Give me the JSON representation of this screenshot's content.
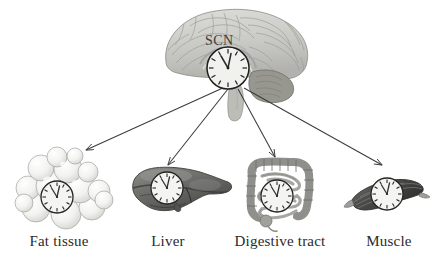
{
  "figure": {
    "title_visible": false,
    "background_color": "#ffffff",
    "brain": {
      "region_label": "SCN",
      "icon_name": "brain-sagittal-illustration",
      "fill_color": "#cfcfcb",
      "outline_color": "#8c8c88",
      "cerebellum_color": "#9a9a96",
      "brainstem_color": "#b5b5b1"
    },
    "clock": {
      "icon_name": "clock-face",
      "face_color": "#f4f4f2",
      "rim_color": "#262626",
      "hand_color": "#3a3a3a",
      "time_shown": "11:57"
    },
    "arrow": {
      "color": "#3c3c3c",
      "count": 4
    },
    "targets": [
      {
        "label": "Fat tissue",
        "icon_name": "fat-tissue-adipocytes-illustration",
        "fill_color": "#f0f0ee",
        "outline_color": "#a9a9a5"
      },
      {
        "label": "Liver",
        "icon_name": "liver-illustration",
        "fill_color": "#6f6f6c",
        "outline_color": "#3f3f3d"
      },
      {
        "label": "Digestive tract",
        "icon_name": "digestive-tract-intestines-illustration",
        "fill_color": "#bdbdb9",
        "outline_color": "#6a6a66"
      },
      {
        "label": "Muscle",
        "icon_name": "skeletal-muscle-illustration",
        "fill_color": "#5a5a57",
        "outline_color": "#333331"
      }
    ]
  }
}
